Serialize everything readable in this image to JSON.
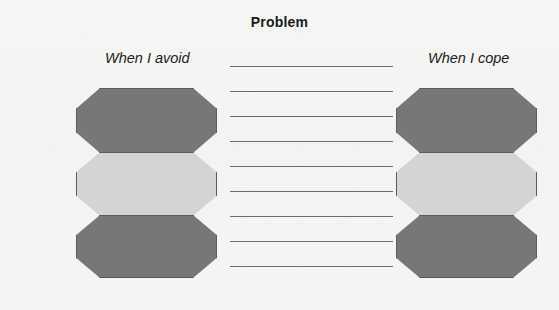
{
  "worksheet": {
    "title": "Problem",
    "background_color": "#f4f4f2",
    "captions": {
      "left": "When I avoid",
      "right": "When I cope"
    },
    "shape_colors": {
      "dark": "#77777a",
      "light": "#d4d4d2",
      "outline": "#5b5b5e"
    },
    "left_stack": {
      "name": "avoid-octagon-stack",
      "shapes": [
        {
          "fill": "dark",
          "label": ""
        },
        {
          "fill": "light",
          "label": ""
        },
        {
          "fill": "dark",
          "label": ""
        }
      ]
    },
    "right_stack": {
      "name": "cope-octagon-stack",
      "shapes": [
        {
          "fill": "dark",
          "label": ""
        },
        {
          "fill": "light",
          "label": ""
        },
        {
          "fill": "dark",
          "label": ""
        }
      ]
    },
    "writing_lines": {
      "count": 9,
      "values": [
        "",
        "",
        "",
        "",
        "",
        "",
        "",
        "",
        ""
      ],
      "color": "#6d6d6d",
      "spacing_px": 25
    }
  }
}
